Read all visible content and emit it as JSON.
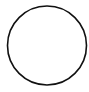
{
  "canvas": {
    "width": 89,
    "height": 92,
    "background": "#ffffff"
  },
  "shape": {
    "type": "circle",
    "cx": 47,
    "cy": 45.5,
    "r": 39.5,
    "stroke": "#111111",
    "stroke_width": 1.6,
    "fill": "none"
  }
}
